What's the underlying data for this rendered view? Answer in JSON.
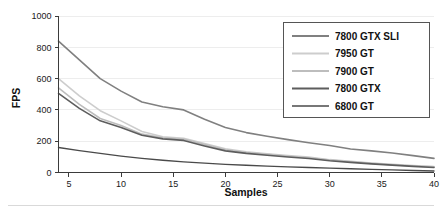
{
  "chart_data": {
    "type": "line",
    "title": "",
    "xlabel": "Samples",
    "ylabel": "FPS",
    "xlim": [
      4,
      40
    ],
    "ylim": [
      0,
      1000
    ],
    "grid": true,
    "legend_position": "top-right",
    "x_ticks": [
      5,
      10,
      15,
      20,
      25,
      30,
      35,
      40
    ],
    "y_ticks": [
      0,
      200,
      400,
      600,
      800,
      1000
    ],
    "x": [
      4,
      6,
      8,
      10,
      12,
      14,
      16,
      18,
      20,
      22,
      24,
      26,
      28,
      30,
      32,
      34,
      36,
      38,
      40
    ],
    "series": [
      {
        "name": "7800 GTX SLI",
        "color": "#808080",
        "width": 1.6,
        "values": [
          840,
          720,
          600,
          520,
          450,
          420,
          400,
          340,
          288,
          255,
          232,
          210,
          190,
          172,
          150,
          138,
          125,
          108,
          90
        ]
      },
      {
        "name": "7950 GT",
        "color": "#cdcdcd",
        "width": 1.6,
        "values": [
          600,
          490,
          395,
          330,
          262,
          228,
          218,
          185,
          152,
          132,
          120,
          108,
          98,
          82,
          72,
          60,
          52,
          44,
          38
        ]
      },
      {
        "name": "7900 GT",
        "color": "#bdbdbd",
        "width": 1.6,
        "values": [
          540,
          435,
          345,
          300,
          245,
          222,
          212,
          178,
          145,
          128,
          116,
          104,
          94,
          79,
          69,
          58,
          50,
          42,
          36
        ]
      },
      {
        "name": "7800 GTX",
        "color": "#5d5d5d",
        "width": 1.6,
        "values": [
          505,
          410,
          330,
          288,
          238,
          215,
          205,
          170,
          138,
          122,
          110,
          99,
          89,
          75,
          65,
          55,
          47,
          39,
          32
        ]
      },
      {
        "name": "6800 GT",
        "color": "#4a4a4a",
        "width": 1.4,
        "values": [
          160,
          140,
          122,
          105,
          90,
          78,
          68,
          60,
          52,
          46,
          41,
          36,
          32,
          28,
          24,
          20,
          17,
          13,
          10
        ]
      }
    ]
  },
  "legend": {
    "items": [
      {
        "label": "7800 GTX SLI"
      },
      {
        "label": "7950 GT"
      },
      {
        "label": "7900 GT"
      },
      {
        "label": "7800 GTX"
      },
      {
        "label": "6800 GT"
      }
    ]
  },
  "axes": {
    "y_title": "FPS",
    "x_title": "Samples",
    "y_tick_labels": [
      "1000",
      "800",
      "600",
      "400",
      "200",
      "0"
    ],
    "x_tick_labels": [
      "5",
      "10",
      "15",
      "20",
      "25",
      "30",
      "35",
      "40"
    ]
  }
}
